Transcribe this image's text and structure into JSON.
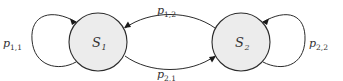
{
  "diagram": {
    "type": "markov-chain",
    "states": [
      {
        "id": "S1",
        "label": "S",
        "subscript": "1",
        "fill": "#ececec"
      },
      {
        "id": "S2",
        "label": "S",
        "subscript": "2",
        "fill": "#ececec"
      }
    ],
    "transitions": [
      {
        "from": "S1",
        "to": "S1",
        "label": "p",
        "subscript": "1,1"
      },
      {
        "from": "S1",
        "to": "S2",
        "label": "p",
        "subscript": "1,2"
      },
      {
        "from": "S2",
        "to": "S1",
        "label": "p",
        "subscript": "2,1"
      },
      {
        "from": "S2",
        "to": "S2",
        "label": "p",
        "subscript": "2,2"
      }
    ]
  }
}
